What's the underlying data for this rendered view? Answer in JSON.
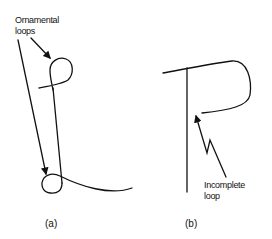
{
  "figure": {
    "panel_a": {
      "caption": "(a)",
      "annotation_line1": "Ornamental",
      "annotation_line2": "loops"
    },
    "panel_b": {
      "caption": "(b)",
      "annotation_line1": "Incomplete",
      "annotation_line2": "loop"
    },
    "stroke_color": "#111111",
    "background": "#ffffff"
  }
}
